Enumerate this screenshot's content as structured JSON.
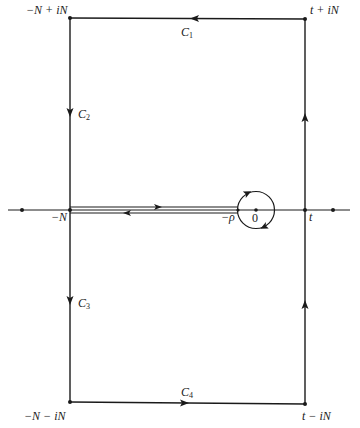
{
  "figure": {
    "type": "contour-integration-diagram"
  },
  "corners": {
    "top_left": "−N + iN",
    "top_right": "t + iN",
    "bottom_left": "−N − iN",
    "bottom_right": "t − iN"
  },
  "axis_labels": {
    "minus_N": "−N",
    "minus_rho": "−ρ",
    "zero": "0",
    "t": "t"
  },
  "contours": [
    {
      "name": "C",
      "sub": "1",
      "edge": "top",
      "direction": "leftward"
    },
    {
      "name": "C",
      "sub": "2",
      "edge": "left-upper",
      "direction": "downward"
    },
    {
      "name": "C",
      "sub": "3",
      "edge": "left-lower",
      "direction": "downward"
    },
    {
      "name": "C",
      "sub": "4",
      "edge": "bottom",
      "direction": "rightward"
    }
  ],
  "colors": {
    "ink": "#1a1a1a",
    "background": "#ffffff"
  }
}
